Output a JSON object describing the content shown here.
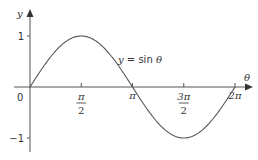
{
  "chart_data": {
    "type": "line",
    "title": "",
    "xlabel": "θ",
    "ylabel": "y",
    "xlim": [
      0,
      6.2832
    ],
    "ylim": [
      -1,
      1
    ],
    "grid": false,
    "legend": null,
    "series": [
      {
        "name": "y = sin θ",
        "function": "sin",
        "x": [
          0,
          0.7854,
          1.5708,
          2.3562,
          3.1416,
          3.927,
          4.7124,
          5.4978,
          6.2832
        ],
        "y": [
          0,
          0.7071,
          1,
          0.7071,
          0,
          -0.7071,
          -1,
          -0.7071,
          0
        ],
        "color": "#555555"
      }
    ],
    "x_ticks": [
      {
        "value": 1.5708,
        "num": "π",
        "den": "2"
      },
      {
        "value": 3.1416,
        "num": "π",
        "den": ""
      },
      {
        "value": 4.7124,
        "num": "3π",
        "den": "2"
      },
      {
        "value": 6.2832,
        "num": "2π",
        "den": ""
      }
    ],
    "y_ticks": [
      {
        "value": 1,
        "label": "1"
      },
      {
        "value": -1,
        "label": "−1"
      }
    ],
    "origin_label": "0",
    "annotations": [
      {
        "text_prefix": "y",
        "text_mid": " = sin ",
        "text_suffix": "θ",
        "near_x": 2.5
      }
    ],
    "axis_color": "#555555"
  }
}
